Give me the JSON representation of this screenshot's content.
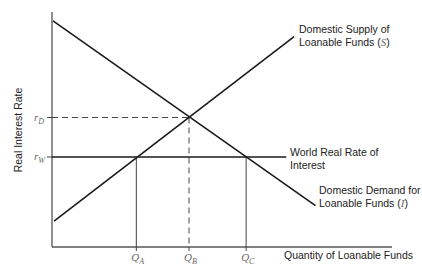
{
  "chart_data": {
    "type": "line",
    "title": "",
    "xlabel": "Quantity of Loanable Funds",
    "ylabel": "Real Interest Rate",
    "xlim": [
      0,
      100
    ],
    "ylim": [
      0,
      100
    ],
    "grid": false,
    "series": [
      {
        "name": "Domestic Supply of Loanable Funds (S)",
        "label_lines": [
          "Domestic Supply of",
          "Loanable Funds ("
        ],
        "label_symbol": "S",
        "points": [
          [
            0.6,
            11
          ],
          [
            71.2,
            89.5
          ]
        ]
      },
      {
        "name": "Domestic Demand for Loanable Funds (I)",
        "label_lines": [
          "Domestic Demand for",
          "Loanable Funds ("
        ],
        "label_symbol": "I",
        "points": [
          [
            0.3,
            96.2
          ],
          [
            77.5,
            17.6
          ]
        ]
      },
      {
        "name": "World Real Rate of Interest",
        "label_lines": [
          "World Real Rate of",
          "Interest"
        ],
        "points": [
          [
            0,
            38.3
          ],
          [
            68.9,
            38.3
          ]
        ]
      }
    ],
    "y_ticks": [
      {
        "main": "r",
        "sub": "D",
        "value": 55.1
      },
      {
        "main": "r",
        "sub": "W",
        "value": 38.3
      }
    ],
    "x_ticks": [
      {
        "main": "Q",
        "sub": "A",
        "value": 24.8
      },
      {
        "main": "Q",
        "sub": "B",
        "value": 40.3
      },
      {
        "main": "Q",
        "sub": "C",
        "value": 57.1
      }
    ],
    "guides": [
      {
        "from": "r_D",
        "to": "Q_B",
        "style": "dashed",
        "x": 40.3,
        "y": 55.1
      },
      {
        "from": "r_W",
        "to": "Q_A",
        "style": "solid",
        "x": 24.8,
        "y": 38.3
      },
      {
        "from": "r_W",
        "to": "Q_C",
        "style": "solid",
        "x": 57.1,
        "y": 38.3
      }
    ]
  }
}
